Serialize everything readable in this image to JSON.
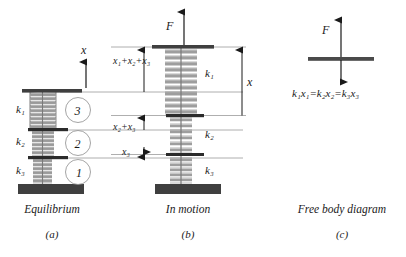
{
  "diagram": {
    "colors": {
      "base_plate": "#3f3f3f",
      "divider_plate": "#2b2b2b",
      "spring": "#b0b0b0",
      "spring_outline": "#6e6e6e",
      "line": "#8c8c8c",
      "text": "#1a1a1a"
    }
  },
  "panel_a": {
    "caption": "Equilibrium",
    "id": "(a)",
    "axis_label": "x",
    "spring_labels": [
      "k₁",
      "k₂",
      "k₃"
    ],
    "circle_numbers": [
      "3",
      "2",
      "1"
    ]
  },
  "panel_b": {
    "caption": "In motion",
    "id": "(b)",
    "force_label": "F",
    "displacement_label": "x",
    "spring_labels": [
      "k₁",
      "k₂",
      "k₃"
    ],
    "dimension_labels": [
      "x₁+x₂+x₃",
      "x₂+x₃",
      "x₃"
    ]
  },
  "panel_c": {
    "caption": "Free body diagram",
    "id": "(c)",
    "force_label": "F",
    "equation": "k₁x₁=k₂x₂=k₃x₃"
  }
}
